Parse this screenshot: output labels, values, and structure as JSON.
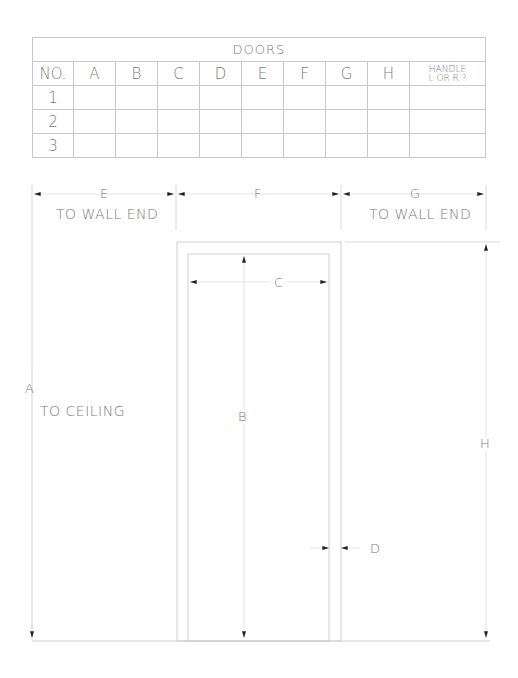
{
  "schedule": {
    "title": "DOORS",
    "columns": [
      "NO.",
      "A",
      "B",
      "C",
      "D",
      "E",
      "F",
      "G",
      "H",
      "HANDLE L OR R ?"
    ],
    "handle_line1": "HANDLE",
    "handle_line2": "L OR R ?",
    "rows": [
      {
        "no": "1",
        "values": [
          "",
          "",
          "",
          "",
          "",
          "",
          "",
          "",
          ""
        ]
      },
      {
        "no": "2",
        "values": [
          "",
          "",
          "",
          "",
          "",
          "",
          "",
          "",
          ""
        ]
      },
      {
        "no": "3",
        "values": [
          "",
          "",
          "",
          "",
          "",
          "",
          "",
          "",
          ""
        ]
      }
    ]
  },
  "dimensions": {
    "E": {
      "letter": "E",
      "note": "TO WALL END"
    },
    "F": {
      "letter": "F"
    },
    "G": {
      "letter": "G",
      "note": "TO WALL END"
    },
    "A": {
      "letter": "A",
      "note": "TO CEILING"
    },
    "B": {
      "letter": "B"
    },
    "C": {
      "letter": "C"
    },
    "D": {
      "letter": "D"
    },
    "H": {
      "letter": "H"
    }
  }
}
